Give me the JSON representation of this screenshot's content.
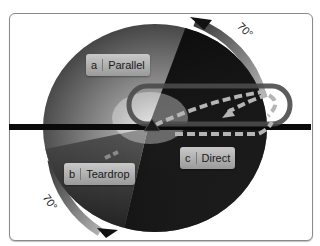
{
  "diagram": {
    "entries": [
      {
        "letter": "a",
        "name": "Parallel"
      },
      {
        "letter": "b",
        "name": "Teardrop"
      },
      {
        "letter": "c",
        "name": "Direct"
      }
    ],
    "angles": {
      "top_right": "70°",
      "bottom_left": "70°"
    }
  }
}
